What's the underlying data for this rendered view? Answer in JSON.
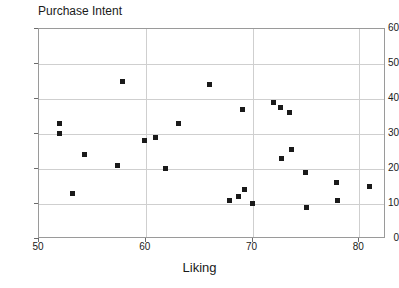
{
  "chart_data": {
    "type": "scatter",
    "title": "Purchase Intent",
    "xlabel": "Liking",
    "ylabel": "",
    "xlim": [
      50,
      82.5
    ],
    "ylim": [
      0,
      60
    ],
    "grid": true,
    "legend": null,
    "x_ticks": [
      50,
      60,
      70,
      80
    ],
    "y_ticks": [
      0,
      10,
      20,
      30,
      40,
      50,
      60
    ],
    "marker": "filled-square",
    "marker_color": "#1a1a1a",
    "points": [
      {
        "x": 52.0,
        "y": 33
      },
      {
        "x": 52.0,
        "y": 30
      },
      {
        "x": 53.2,
        "y": 13
      },
      {
        "x": 54.3,
        "y": 24
      },
      {
        "x": 57.4,
        "y": 21
      },
      {
        "x": 57.9,
        "y": 45
      },
      {
        "x": 59.9,
        "y": 28
      },
      {
        "x": 61.0,
        "y": 29
      },
      {
        "x": 61.9,
        "y": 20
      },
      {
        "x": 63.1,
        "y": 33
      },
      {
        "x": 66.0,
        "y": 44
      },
      {
        "x": 67.9,
        "y": 11
      },
      {
        "x": 68.7,
        "y": 12
      },
      {
        "x": 69.3,
        "y": 14
      },
      {
        "x": 69.1,
        "y": 37
      },
      {
        "x": 70.0,
        "y": 10
      },
      {
        "x": 72.0,
        "y": 39
      },
      {
        "x": 72.7,
        "y": 37.5
      },
      {
        "x": 72.8,
        "y": 23
      },
      {
        "x": 73.5,
        "y": 36
      },
      {
        "x": 73.7,
        "y": 25.5
      },
      {
        "x": 75.0,
        "y": 19
      },
      {
        "x": 75.1,
        "y": 9
      },
      {
        "x": 77.9,
        "y": 16
      },
      {
        "x": 78.0,
        "y": 11
      },
      {
        "x": 81.0,
        "y": 15
      }
    ]
  }
}
